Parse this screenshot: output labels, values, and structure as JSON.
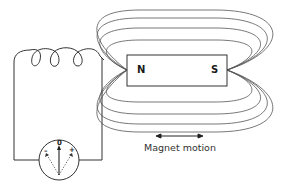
{
  "diagram": {
    "type": "electromagnetic induction",
    "magnet": {
      "north_label": "N",
      "south_label": "S"
    },
    "galvanometer": {
      "zero_label": "0",
      "negative_label": "–",
      "positive_label": "+"
    },
    "caption": "Magnet motion",
    "colors": {
      "line": "#333333",
      "field_line": "#555555",
      "background": "#ffffff"
    }
  }
}
